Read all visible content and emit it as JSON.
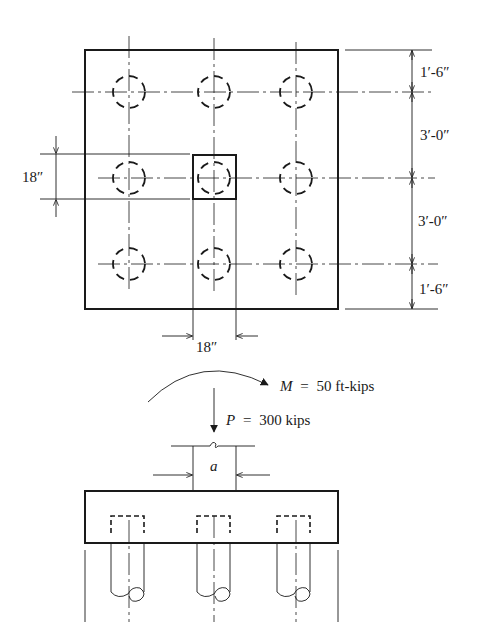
{
  "figure": {
    "type": "pile cap foundation plan and elevation",
    "colors": {
      "ink": "#1a1a1a",
      "background": "#ffffff"
    }
  },
  "plan": {
    "pile_grid": {
      "rows": 3,
      "columns": 3,
      "count": 9
    },
    "column_label": "18″",
    "column_width_left": "18″",
    "column_width_bottom": "18″",
    "dimensions_right": [
      {
        "label": "1′-6″"
      },
      {
        "label": "3′-0″"
      },
      {
        "label": "3′-0″"
      },
      {
        "label": "1′-6″"
      }
    ]
  },
  "elevation": {
    "moment": {
      "symbol": "M",
      "equals": "=",
      "value": "50 ft-kips",
      "label": "M = 50 ft-kips"
    },
    "load": {
      "symbol": "P",
      "equals": "=",
      "value": "300 kips",
      "label": "P = 300 kips"
    },
    "column_dimension": "a",
    "piles_shown": 3
  }
}
